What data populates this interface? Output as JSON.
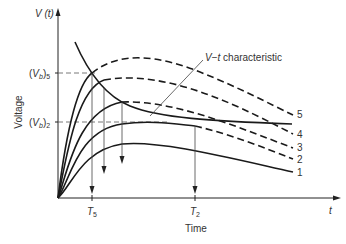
{
  "figure": {
    "y_axis_symbol": "V (t)",
    "y_axis_label": "Voltage",
    "x_axis_symbol": "t",
    "x_axis_label": "Time",
    "y_ticks": [
      {
        "label": "(V",
        "sub_b": "b",
        "close": ")",
        "index": "5",
        "full": "(Vb)5"
      },
      {
        "label": "(V",
        "sub_b": "b",
        "close": ")",
        "index": "2",
        "full": "(Vb)2"
      }
    ],
    "x_ticks": [
      {
        "label": "T",
        "index": "5",
        "full": "T5"
      },
      {
        "label": "T",
        "index": "2",
        "full": "T2"
      }
    ],
    "annotation": "V−t characteristic",
    "curve_labels": [
      "5",
      "4",
      "3",
      "2",
      "1"
    ],
    "curve_styles": {
      "1": "solid",
      "2": "dashed",
      "3": "dashed",
      "4": "dashed",
      "5": "dashed"
    },
    "colors": {
      "line": "#1a1a1a",
      "text": "#333333",
      "background": "#ffffff"
    }
  }
}
